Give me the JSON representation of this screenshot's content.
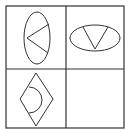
{
  "puzzle": {
    "title": "2x2 figure grid puzzle",
    "stroke_color": "#333333",
    "background_color": "#ffffff",
    "grid": {
      "rows": 2,
      "cols": 2,
      "outer": {
        "x": 6,
        "y": 6,
        "width": 118,
        "height": 122
      },
      "divider_x": 66,
      "divider_y": 69
    },
    "cells": [
      {
        "position": "top-left",
        "outer_shape": "vertical-ellipse",
        "inner_shape": "v-chevron-pointing-left",
        "description": "Vertical ellipse with a V opening to the right"
      },
      {
        "position": "top-right",
        "outer_shape": "horizontal-ellipse",
        "inner_shape": "v-chevron-pointing-down",
        "description": "Horizontal ellipse with a V opening upward"
      },
      {
        "position": "bottom-left",
        "outer_shape": "diamond",
        "inner_shape": "right-semicircle",
        "description": "Diamond with a semicircle bulging to the right"
      },
      {
        "position": "bottom-right",
        "outer_shape": "empty",
        "inner_shape": "empty",
        "description": "Empty cell (missing answer)"
      }
    ]
  }
}
